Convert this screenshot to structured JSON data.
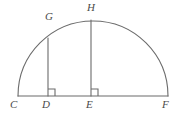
{
  "figure": {
    "type": "geometry-diagram",
    "canvas": {
      "width": 180,
      "height": 117
    },
    "stroke_color": "#6b6b6b",
    "label_color": "#4a4a4a",
    "background_color": "#ffffff",
    "stroke_width": 1.1
  },
  "labels": {
    "C": "C",
    "D": "D",
    "E": "E",
    "F": "F",
    "G": "G",
    "H": "H"
  },
  "points": {
    "C": {
      "x": 18,
      "y": 96
    },
    "D": {
      "x": 48,
      "y": 96
    },
    "E": {
      "x": 91,
      "y": 96
    },
    "F": {
      "x": 168,
      "y": 96
    },
    "G": {
      "x": 48,
      "y": 38
    },
    "H": {
      "x": 91,
      "y": 20
    }
  },
  "geometry": {
    "baseline": {
      "from": "C",
      "to": "F"
    },
    "arc": {
      "center_x": 93,
      "center_y": 96,
      "radius": 75,
      "from": "C",
      "to": "F"
    },
    "segments": [
      {
        "name": "GD",
        "from": "G",
        "to": "D"
      },
      {
        "name": "HE",
        "from": "H",
        "to": "E"
      }
    ],
    "right_angles": [
      {
        "at": "D",
        "opens": "right",
        "size": 7
      },
      {
        "at": "E",
        "opens": "right",
        "size": 7
      }
    ]
  }
}
